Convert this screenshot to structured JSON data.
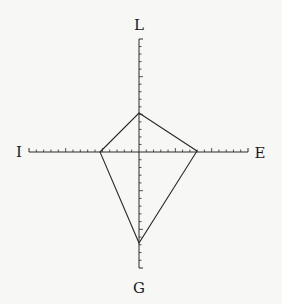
{
  "diagram": {
    "type": "radar-kite",
    "axes": {
      "top": "L",
      "bottom": "G",
      "left": "I",
      "right": "E"
    },
    "scale": {
      "minor_ticks_per_half_axis": 15,
      "major_tick_every": 5
    },
    "profile": {
      "L": 5,
      "E": 7.7,
      "G": 12,
      "I": 5.2
    },
    "colors": {
      "line": "#2a2a2a",
      "background": "#f7f7f5"
    }
  }
}
